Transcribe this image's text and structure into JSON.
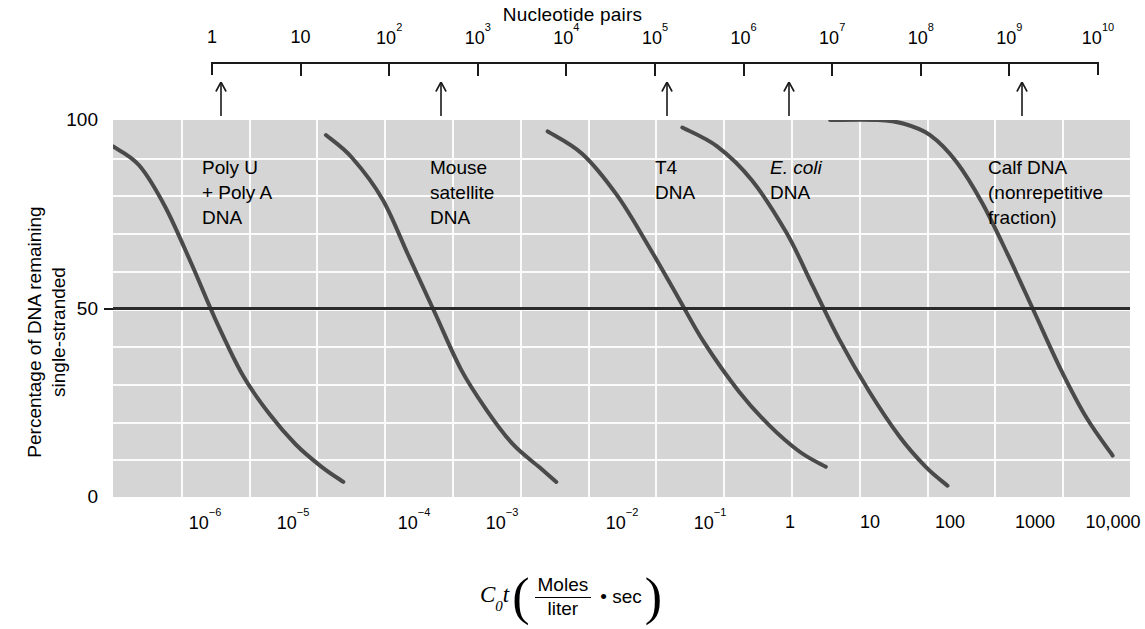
{
  "top_axis": {
    "title": "Nucleotide pairs",
    "ticks": [
      {
        "label": "1",
        "base": "1",
        "exp": ""
      },
      {
        "label": "10",
        "base": "10",
        "exp": ""
      },
      {
        "label": "10^2",
        "base": "10",
        "exp": "2"
      },
      {
        "label": "10^3",
        "base": "10",
        "exp": "3"
      },
      {
        "label": "10^4",
        "base": "10",
        "exp": "4"
      },
      {
        "label": "10^5",
        "base": "10",
        "exp": "5"
      },
      {
        "label": "10^6",
        "base": "10",
        "exp": "6"
      },
      {
        "label": "10^7",
        "base": "10",
        "exp": "7"
      },
      {
        "label": "10^8",
        "base": "10",
        "exp": "8"
      },
      {
        "label": "10^9",
        "base": "10",
        "exp": "9"
      },
      {
        "label": "10^10",
        "base": "10",
        "exp": "10"
      }
    ]
  },
  "y_axis": {
    "title_line1": "Percentage of DNA remaining",
    "title_line2": "single-stranded",
    "ticks": [
      "100",
      "50",
      "0"
    ]
  },
  "x_axis": {
    "ticks": [
      {
        "base": "10",
        "exp": "−6"
      },
      {
        "base": "10",
        "exp": "−5"
      },
      {
        "base": "10",
        "exp": "−4"
      },
      {
        "base": "10",
        "exp": "−3"
      },
      {
        "base": "10",
        "exp": "−2"
      },
      {
        "base": "10",
        "exp": "−1"
      },
      {
        "base": "1",
        "exp": ""
      },
      {
        "base": "10",
        "exp": ""
      },
      {
        "base": "100",
        "exp": ""
      },
      {
        "base": "1000",
        "exp": ""
      },
      {
        "base": "10,000",
        "exp": ""
      }
    ],
    "title_symbol": "C",
    "title_sub": "0",
    "title_italic_t": "t",
    "title_numerator": "Moles",
    "title_denominator": "liter",
    "title_tail": "• sec"
  },
  "annotations": [
    {
      "name": "poly-u-poly-a",
      "text": "Poly U\n+ Poly A\nDNA",
      "italic_prefix": "",
      "x": 202,
      "y": 155
    },
    {
      "name": "mouse-satellite",
      "text": "Mouse\nsatellite\nDNA",
      "italic_prefix": "",
      "x": 430,
      "y": 155
    },
    {
      "name": "t4-dna",
      "text": "T4\nDNA",
      "italic_prefix": "",
      "x": 655,
      "y": 155
    },
    {
      "name": "e-coli-dna",
      "text": "DNA",
      "italic_prefix": "E. coli",
      "x": 770,
      "y": 155
    },
    {
      "name": "calf-dna",
      "text": "Calf DNA\n(nonrepetitive\nfraction)",
      "italic_prefix": "",
      "x": 988,
      "y": 155
    }
  ],
  "chart_data": {
    "type": "line",
    "title": "",
    "xlabel": "C0t (Moles/liter • sec)",
    "ylabel": "Percentage of DNA remaining single-stranded",
    "xlim_log10": [
      -7.0,
      4.7
    ],
    "ylim": [
      0,
      100
    ],
    "grid": true,
    "legend": "none",
    "secondary_axis": {
      "label": "Nucleotide pairs",
      "ticks": [
        1,
        10,
        100,
        1000,
        10000,
        100000,
        1000000,
        10000000,
        100000000,
        1000000000,
        10000000000
      ]
    },
    "reference_line": {
      "y": 50,
      "style": "solid-dark"
    },
    "series": [
      {
        "name": "Poly U + Poly A DNA",
        "nucleotide_pairs": 1,
        "cot_half": 3.5e-07,
        "points": [
          {
            "log_cot": -7.0,
            "pct": 93
          },
          {
            "log_cot": -6.7,
            "pct": 88
          },
          {
            "log_cot": -6.4,
            "pct": 77
          },
          {
            "log_cot": -6.1,
            "pct": 62
          },
          {
            "log_cot": -5.8,
            "pct": 46
          },
          {
            "log_cot": -5.5,
            "pct": 32
          },
          {
            "log_cot": -5.2,
            "pct": 22
          },
          {
            "log_cot": -4.9,
            "pct": 14
          },
          {
            "log_cot": -4.6,
            "pct": 8
          },
          {
            "log_cot": -4.35,
            "pct": 4
          }
        ]
      },
      {
        "name": "Mouse satellite DNA",
        "nucleotide_pairs": 300,
        "cot_half": 0.0006,
        "points": [
          {
            "log_cot": -4.55,
            "pct": 96
          },
          {
            "log_cot": -4.25,
            "pct": 90
          },
          {
            "log_cot": -3.9,
            "pct": 79
          },
          {
            "log_cot": -3.6,
            "pct": 64
          },
          {
            "log_cot": -3.3,
            "pct": 49
          },
          {
            "log_cot": -3.0,
            "pct": 34
          },
          {
            "log_cot": -2.7,
            "pct": 23
          },
          {
            "log_cot": -2.4,
            "pct": 14
          },
          {
            "log_cot": -2.1,
            "pct": 8
          },
          {
            "log_cot": -1.9,
            "pct": 4
          }
        ]
      },
      {
        "name": "T4 DNA",
        "nucleotide_pairs": 180000,
        "cot_half": 0.35,
        "points": [
          {
            "log_cot": -2.0,
            "pct": 97
          },
          {
            "log_cot": -1.6,
            "pct": 91
          },
          {
            "log_cot": -1.2,
            "pct": 80
          },
          {
            "log_cot": -0.85,
            "pct": 67
          },
          {
            "log_cot": -0.5,
            "pct": 53
          },
          {
            "log_cot": -0.2,
            "pct": 41
          },
          {
            "log_cot": 0.2,
            "pct": 28
          },
          {
            "log_cot": 0.55,
            "pct": 19
          },
          {
            "log_cot": 0.9,
            "pct": 12
          },
          {
            "log_cot": 1.2,
            "pct": 8
          }
        ]
      },
      {
        "name": "E. coli DNA",
        "nucleotide_pairs": 4500000,
        "cot_half": 8,
        "points": [
          {
            "log_cot": -0.45,
            "pct": 98
          },
          {
            "log_cot": -0.05,
            "pct": 93
          },
          {
            "log_cot": 0.35,
            "pct": 84
          },
          {
            "log_cot": 0.75,
            "pct": 70
          },
          {
            "log_cot": 1.05,
            "pct": 56
          },
          {
            "log_cot": 1.35,
            "pct": 42
          },
          {
            "log_cot": 1.7,
            "pct": 28
          },
          {
            "log_cot": 2.05,
            "pct": 16
          },
          {
            "log_cot": 2.35,
            "pct": 8
          },
          {
            "log_cot": 2.6,
            "pct": 3
          }
        ]
      },
      {
        "name": "Calf DNA (nonrepetitive fraction)",
        "nucleotide_pairs": 3000000000,
        "cot_half": 3000,
        "points": [
          {
            "log_cot": 1.25,
            "pct": 100
          },
          {
            "log_cot": 1.8,
            "pct": 100
          },
          {
            "log_cot": 2.1,
            "pct": 99
          },
          {
            "log_cot": 2.4,
            "pct": 96
          },
          {
            "log_cot": 2.7,
            "pct": 89
          },
          {
            "log_cot": 3.0,
            "pct": 78
          },
          {
            "log_cot": 3.3,
            "pct": 64
          },
          {
            "log_cot": 3.6,
            "pct": 49
          },
          {
            "log_cot": 3.9,
            "pct": 34
          },
          {
            "log_cot": 4.2,
            "pct": 21
          },
          {
            "log_cot": 4.5,
            "pct": 11
          }
        ]
      }
    ]
  }
}
